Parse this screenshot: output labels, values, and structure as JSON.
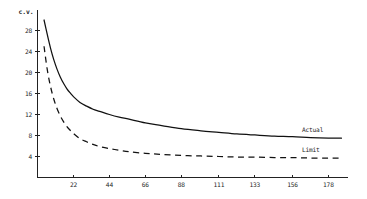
{
  "chart_data": {
    "type": "line",
    "title": "",
    "subtitle": "",
    "xlabel": "",
    "ylabel": "c.v.",
    "grid": false,
    "legend_position": "inline-right",
    "xlim": [
      0,
      190
    ],
    "ylim": [
      0,
      32
    ],
    "x_ticks": [
      22,
      44,
      66,
      88,
      111,
      133,
      156,
      178
    ],
    "y_ticks": [
      4,
      8,
      12,
      16,
      20,
      24,
      28
    ],
    "x": [
      4,
      6,
      8,
      10,
      12,
      14,
      16,
      18,
      20,
      22,
      26,
      30,
      34,
      38,
      44,
      50,
      56,
      66,
      76,
      88,
      100,
      111,
      122,
      133,
      145,
      156,
      167,
      178,
      186
    ],
    "series": [
      {
        "name": "Actual",
        "style": "solid",
        "values": [
          30.0,
          27.2,
          24.6,
          22.4,
          20.6,
          19.1,
          17.9,
          16.9,
          16.1,
          15.4,
          14.3,
          13.6,
          13.0,
          12.6,
          12.0,
          11.5,
          11.1,
          10.4,
          9.9,
          9.3,
          8.9,
          8.6,
          8.3,
          8.1,
          7.9,
          7.8,
          7.6,
          7.5,
          7.5
        ]
      },
      {
        "name": "Limit",
        "style": "dashed",
        "values": [
          25.0,
          20.5,
          17.3,
          14.9,
          13.1,
          11.7,
          10.6,
          9.7,
          9.0,
          8.4,
          7.4,
          6.8,
          6.3,
          5.9,
          5.5,
          5.2,
          4.9,
          4.6,
          4.4,
          4.2,
          4.1,
          4.0,
          3.9,
          3.9,
          3.8,
          3.8,
          3.7,
          3.7,
          3.7
        ]
      }
    ]
  },
  "labels": {
    "y_axis_title": "c.v.",
    "series_actual": "Actual",
    "series_limit": "Limit",
    "y_ticks": [
      "28",
      "24",
      "20",
      "16",
      "12",
      "8",
      "4"
    ],
    "x_ticks": [
      "22",
      "44",
      "66",
      "88",
      "111",
      "133",
      "156",
      "178"
    ]
  },
  "colors": {
    "ink": "#111111",
    "axis": "#222222",
    "background": "#ffffff"
  }
}
